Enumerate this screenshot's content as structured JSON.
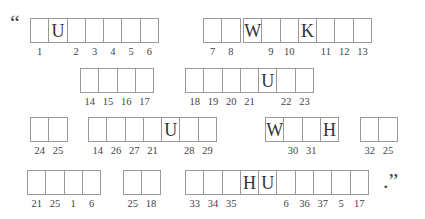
{
  "puzzle": {
    "type": "cryptogram",
    "open_quote": "“",
    "close_punct": ".”",
    "rows": [
      {
        "groups": [
          {
            "x": 30,
            "cells": [
              {
                "letter": "",
                "num": "1"
              },
              {
                "letter": "U",
                "num": ""
              },
              {
                "letter": "",
                "num": "2"
              },
              {
                "letter": "",
                "num": "3"
              },
              {
                "letter": "",
                "num": "4"
              },
              {
                "letter": "",
                "num": "5"
              },
              {
                "letter": "",
                "num": "6"
              }
            ]
          },
          {
            "x": 203,
            "cells": [
              {
                "letter": "",
                "num": "7"
              },
              {
                "letter": "",
                "num": "8"
              }
            ]
          },
          {
            "x": 243,
            "cells": [
              {
                "letter": "W",
                "num": ""
              },
              {
                "letter": "",
                "num": "9"
              },
              {
                "letter": "",
                "num": "10"
              },
              {
                "letter": "K",
                "num": ""
              },
              {
                "letter": "",
                "num": "11"
              },
              {
                "letter": "",
                "num": "12"
              },
              {
                "letter": "",
                "num": "13"
              }
            ]
          }
        ]
      },
      {
        "groups": [
          {
            "x": 80,
            "cells": [
              {
                "letter": "",
                "num": "14"
              },
              {
                "letter": "",
                "num": "15"
              },
              {
                "letter": "",
                "num": "16"
              },
              {
                "letter": "",
                "num": "17"
              }
            ]
          },
          {
            "x": 185,
            "cells": [
              {
                "letter": "",
                "num": "18"
              },
              {
                "letter": "",
                "num": "19"
              },
              {
                "letter": "",
                "num": "20"
              },
              {
                "letter": "",
                "num": "21"
              },
              {
                "letter": "U",
                "num": ""
              },
              {
                "letter": "",
                "num": "22"
              },
              {
                "letter": "",
                "num": "23"
              }
            ]
          }
        ]
      },
      {
        "groups": [
          {
            "x": 30,
            "cells": [
              {
                "letter": "",
                "num": "24"
              },
              {
                "letter": "",
                "num": "25"
              }
            ]
          },
          {
            "x": 88,
            "cells": [
              {
                "letter": "",
                "num": "14"
              },
              {
                "letter": "",
                "num": "26"
              },
              {
                "letter": "",
                "num": "27"
              },
              {
                "letter": "",
                "num": "21"
              },
              {
                "letter": "U",
                "num": ""
              },
              {
                "letter": "",
                "num": "28"
              },
              {
                "letter": "",
                "num": "29"
              }
            ]
          },
          {
            "x": 265,
            "cells": [
              {
                "letter": "W",
                "num": ""
              },
              {
                "letter": "",
                "num": "30"
              },
              {
                "letter": "",
                "num": "31"
              },
              {
                "letter": "H",
                "num": ""
              }
            ]
          },
          {
            "x": 360,
            "cells": [
              {
                "letter": "",
                "num": "32"
              },
              {
                "letter": "",
                "num": "25"
              }
            ]
          }
        ]
      },
      {
        "groups": [
          {
            "x": 27,
            "cells": [
              {
                "letter": "",
                "num": "21"
              },
              {
                "letter": "",
                "num": "25"
              },
              {
                "letter": "",
                "num": "1"
              },
              {
                "letter": "",
                "num": "6"
              }
            ]
          },
          {
            "x": 123,
            "cells": [
              {
                "letter": "",
                "num": "25"
              },
              {
                "letter": "",
                "num": "18"
              }
            ]
          },
          {
            "x": 185,
            "cells": [
              {
                "letter": "",
                "num": "33"
              },
              {
                "letter": "",
                "num": "34"
              },
              {
                "letter": "",
                "num": "35"
              },
              {
                "letter": "H",
                "num": ""
              },
              {
                "letter": "U",
                "num": ""
              },
              {
                "letter": "",
                "num": "6"
              },
              {
                "letter": "",
                "num": "36"
              },
              {
                "letter": "",
                "num": "37"
              },
              {
                "letter": "",
                "num": "5"
              },
              {
                "letter": "",
                "num": "17"
              }
            ]
          }
        ]
      }
    ]
  }
}
